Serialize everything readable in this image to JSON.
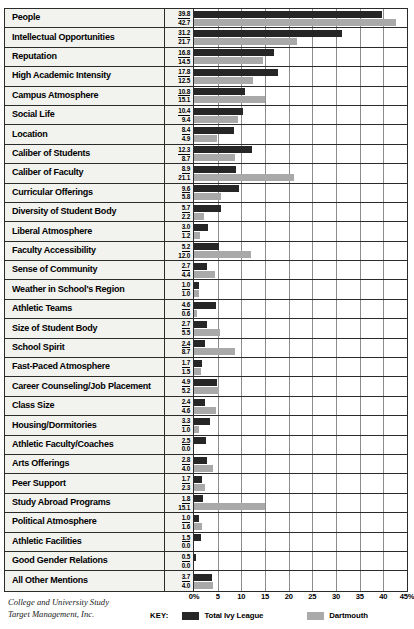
{
  "chart_data": {
    "type": "bar",
    "orientation": "horizontal",
    "title": "",
    "xlabel": "",
    "ylabel": "",
    "xlim": [
      0,
      45
    ],
    "grid": true,
    "legend_position": "bottom",
    "tick_labels": [
      "0%",
      "5",
      "10",
      "15",
      "20",
      "25",
      "30",
      "35",
      "40",
      "45%"
    ],
    "tick_values": [
      0,
      5,
      10,
      15,
      20,
      25,
      30,
      35,
      40,
      45
    ],
    "categories": [
      "People",
      "Intellectual Opportunities",
      "Reputation",
      "High Academic Intensity",
      "Campus Atmosphere",
      "Social Life",
      "Location",
      "Caliber of Students",
      "Caliber of Faculty",
      "Curricular Offerings",
      "Diversity of Student Body",
      "Liberal Atmosphere",
      "Faculty Accessibility",
      "Sense of Community",
      "Weather in School's Region",
      "Athletic Teams",
      "Size of Student Body",
      "School Spirit",
      "Fast-Paced Atmosphere",
      "Career Counseling/Job Placement",
      "Class Size",
      "Housing/Dormitories",
      "Athletic Faculty/Coaches",
      "Arts Offerings",
      "Peer Support",
      "Study Abroad Programs",
      "Political Atmosphere",
      "Athletic Facilities",
      "Good Gender Relations",
      "All Other Mentions"
    ],
    "series": [
      {
        "name": "Total Ivy League",
        "color": "#262626",
        "values": [
          39.8,
          31.2,
          16.8,
          17.8,
          10.8,
          10.4,
          8.4,
          12.3,
          8.9,
          9.6,
          5.7,
          3.0,
          5.2,
          2.7,
          1.0,
          4.6,
          2.7,
          2.4,
          1.7,
          4.9,
          2.4,
          3.3,
          2.5,
          2.8,
          1.7,
          1.8,
          1.0,
          1.5,
          0.5,
          3.7
        ]
      },
      {
        "name": "Dartmouth",
        "color": "#a9a9a9",
        "values": [
          42.7,
          21.7,
          14.5,
          12.5,
          15.1,
          9.4,
          4.9,
          8.7,
          21.1,
          5.8,
          2.2,
          1.2,
          12.0,
          4.4,
          1.0,
          0.6,
          5.5,
          8.7,
          1.5,
          5.2,
          4.6,
          1.0,
          0.0,
          4.0,
          2.3,
          15.1,
          1.6,
          0.0,
          0.0,
          4.0
        ]
      }
    ]
  },
  "legend": {
    "key_label": "KEY:",
    "entries": [
      {
        "label": "Total Ivy League",
        "color": "#262626"
      },
      {
        "label": "Dartmouth",
        "color": "#a9a9a9"
      }
    ]
  },
  "footer": {
    "line1": "College and University Study",
    "line2": "Target Management, Inc."
  }
}
